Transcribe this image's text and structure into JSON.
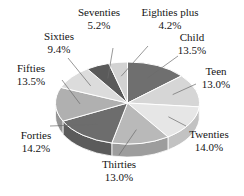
{
  "chart_data": {
    "type": "pie",
    "title": "",
    "subtitle": "",
    "xlabel": "",
    "ylabel": "",
    "legend_position": "none",
    "grid": false,
    "three_d": true,
    "units": "percent",
    "categories": [
      "Child",
      "Teen",
      "Twenties",
      "Thirties",
      "Forties",
      "Fifties",
      "Sixties",
      "Seventies",
      "Eighties plus"
    ],
    "values": [
      13.5,
      13.0,
      14.0,
      13.0,
      14.2,
      13.5,
      9.4,
      5.2,
      4.2
    ],
    "slices": [
      {
        "label": "Child",
        "value": 13.5,
        "value_text": "13.5%",
        "color": "#6f6f6f",
        "side_color": "#5d5d5d"
      },
      {
        "label": "Teen",
        "value": 13.0,
        "value_text": "13.0%",
        "color": "#d6d6d6",
        "side_color": "#b4b4b4"
      },
      {
        "label": "Twenties",
        "value": 14.0,
        "value_text": "14.0%",
        "color": "#e6e6e6",
        "side_color": "#c2c2c2"
      },
      {
        "label": "Thirties",
        "value": 13.0,
        "value_text": "13.0%",
        "color": "#b9b9b9",
        "side_color": "#9d9d9d"
      },
      {
        "label": "Forties",
        "value": 14.2,
        "value_text": "14.2%",
        "color": "#6d6d6d",
        "side_color": "#5b5b5b"
      },
      {
        "label": "Fifties",
        "value": 13.5,
        "value_text": "13.5%",
        "color": "#b0b0b0",
        "side_color": "#949494"
      },
      {
        "label": "Sixties",
        "value": 9.4,
        "value_text": "9.4%",
        "color": "#dcdcdc",
        "side_color": "#bcbcbc"
      },
      {
        "label": "Seventies",
        "value": 5.2,
        "value_text": "5.2%",
        "color": "#5a5a5a",
        "side_color": "#4c4c4c"
      },
      {
        "label": "Eighties plus",
        "value": 4.2,
        "value_text": "4.2%",
        "color": "#d2d2d2",
        "side_color": "#b0b0b0"
      }
    ],
    "colors": {
      "background": "#ffffff",
      "text": "#141414",
      "leader_line": "#6b6b6b",
      "slice_edge": "#ffffff"
    }
  },
  "labels": [
    {
      "name": "Seventies",
      "pct": "5.2%"
    },
    {
      "name": "Eighties plus",
      "pct": "4.2%"
    },
    {
      "name": "Child",
      "pct": "13.5%"
    },
    {
      "name": "Teen",
      "pct": "13.0%"
    },
    {
      "name": "Twenties",
      "pct": "14.0%"
    },
    {
      "name": "Thirties",
      "pct": "13.0%"
    },
    {
      "name": "Forties",
      "pct": "14.2%"
    },
    {
      "name": "Fifties",
      "pct": "13.5%"
    },
    {
      "name": "Sixties",
      "pct": "9.4%"
    }
  ]
}
